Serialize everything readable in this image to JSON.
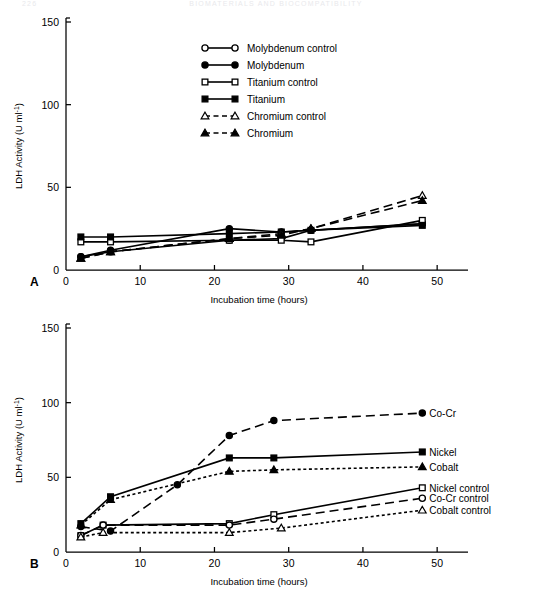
{
  "header": {
    "folio": "226",
    "running_head": "BIOMATERIALS AND BIOCOMPATIBILITY"
  },
  "axis": {
    "y_title": "LDH Activity (U ml",
    "y_title_sup": "-1",
    "y_title_close": ")",
    "x_title": "Incubation time (hours)",
    "y_ticks": [
      "0",
      "50",
      "100",
      "150"
    ],
    "x_ticks": [
      "0",
      "10",
      "20",
      "30",
      "40",
      "50"
    ]
  },
  "panelA": {
    "letter": "A",
    "legend": [
      {
        "label": "Molybdenum control",
        "marker": "circle-open",
        "line": "solid"
      },
      {
        "label": "Molybdenum",
        "marker": "circle-filled",
        "line": "solid"
      },
      {
        "label": "Titanium control",
        "marker": "square-open",
        "line": "solid"
      },
      {
        "label": "Titanium",
        "marker": "square-filled",
        "line": "solid"
      },
      {
        "label": "Chromium control",
        "marker": "triangle-open",
        "line": "dashed"
      },
      {
        "label": "Chromium",
        "marker": "triangle-filled",
        "line": "dashed"
      }
    ]
  },
  "panelB": {
    "letter": "B",
    "series_labels": [
      {
        "label": "Co-Cr",
        "marker": "circle-filled",
        "line": "dashed"
      },
      {
        "label": "Nickel",
        "marker": "square-filled",
        "line": "solid"
      },
      {
        "label": "Cobalt",
        "marker": "triangle-filled",
        "line": "dotted"
      },
      {
        "label": "Nickel control",
        "marker": "square-open",
        "line": "solid"
      },
      {
        "label": "Co-Cr control",
        "marker": "circle-open",
        "line": "dashed"
      },
      {
        "label": "Cobalt control",
        "marker": "triangle-open",
        "line": "dotted"
      }
    ]
  },
  "chart_data": [
    {
      "type": "line",
      "panel": "A",
      "title": "",
      "xlabel": "Incubation time (hours)",
      "ylabel": "LDH Activity (U ml-1)",
      "xlim": [
        0,
        52
      ],
      "ylim": [
        0,
        150
      ],
      "xticks": [
        0,
        10,
        20,
        30,
        40,
        50
      ],
      "yticks": [
        0,
        50,
        100,
        150
      ],
      "grid": false,
      "legend_position": "upper-center",
      "series": [
        {
          "name": "Molybdenum control",
          "marker": "circle-open",
          "line": "solid",
          "x": [
            2,
            6,
            22,
            29,
            33,
            48
          ],
          "y": [
            8,
            11,
            18,
            19,
            24,
            28
          ]
        },
        {
          "name": "Molybdenum",
          "marker": "circle-filled",
          "line": "solid",
          "x": [
            2,
            6,
            22,
            29,
            33,
            48
          ],
          "y": [
            8,
            12,
            25,
            23,
            24,
            28
          ]
        },
        {
          "name": "Titanium control",
          "marker": "square-open",
          "line": "solid",
          "x": [
            2,
            6,
            22,
            29,
            33,
            48
          ],
          "y": [
            17,
            17,
            18,
            18,
            17,
            30
          ]
        },
        {
          "name": "Titanium",
          "marker": "square-filled",
          "line": "solid",
          "x": [
            2,
            6,
            22,
            29,
            33,
            48
          ],
          "y": [
            20,
            20,
            22,
            23,
            24,
            27
          ]
        },
        {
          "name": "Chromium control",
          "marker": "triangle-open",
          "line": "dashed",
          "x": [
            2,
            6,
            22,
            29,
            33,
            48
          ],
          "y": [
            7,
            11,
            19,
            22,
            25,
            45
          ]
        },
        {
          "name": "Chromium",
          "marker": "triangle-filled",
          "line": "dashed",
          "x": [
            2,
            6,
            22,
            29,
            33,
            48
          ],
          "y": [
            7,
            11,
            19,
            21,
            25,
            42
          ]
        }
      ]
    },
    {
      "type": "line",
      "panel": "B",
      "title": "",
      "xlabel": "Incubation time (hours)",
      "ylabel": "LDH Activity (U ml-1)",
      "xlim": [
        0,
        52
      ],
      "ylim": [
        0,
        150
      ],
      "xticks": [
        0,
        10,
        20,
        30,
        40,
        50
      ],
      "yticks": [
        0,
        50,
        100,
        150
      ],
      "grid": false,
      "legend_position": "right-inline",
      "series": [
        {
          "name": "Co-Cr",
          "marker": "circle-filled",
          "line": "dashed",
          "x": [
            2,
            6,
            15,
            22,
            28,
            48
          ],
          "y": [
            17,
            14,
            45,
            78,
            88,
            93
          ]
        },
        {
          "name": "Nickel",
          "marker": "square-filled",
          "line": "solid",
          "x": [
            2,
            6,
            22,
            28,
            48
          ],
          "y": [
            19,
            37,
            63,
            63,
            67
          ]
        },
        {
          "name": "Cobalt",
          "marker": "triangle-filled",
          "line": "dotted",
          "x": [
            2,
            6,
            22,
            28,
            48
          ],
          "y": [
            18,
            35,
            54,
            55,
            57
          ]
        },
        {
          "name": "Nickel control",
          "marker": "square-open",
          "line": "solid",
          "x": [
            2,
            5,
            22,
            28,
            48
          ],
          "y": [
            11,
            18,
            19,
            25,
            43
          ]
        },
        {
          "name": "Co-Cr control",
          "marker": "circle-open",
          "line": "dashed",
          "x": [
            2,
            5,
            22,
            28,
            48
          ],
          "y": [
            11,
            18,
            18,
            22,
            36
          ]
        },
        {
          "name": "Cobalt control",
          "marker": "triangle-open",
          "line": "dotted",
          "x": [
            2,
            5,
            22,
            29,
            48
          ],
          "y": [
            10,
            13,
            13,
            16,
            28
          ]
        }
      ]
    }
  ]
}
